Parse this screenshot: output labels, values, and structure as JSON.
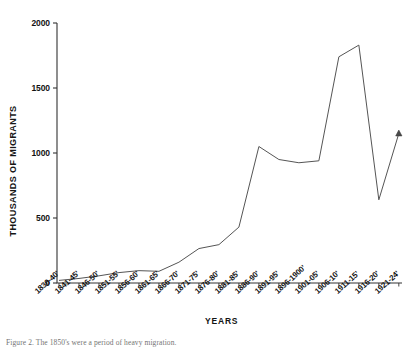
{
  "figure": {
    "caption": "Figure 2. The 1850's were a period of heavy migration.",
    "background_color": "#ffffff",
    "line_color": "#555555",
    "axis_color": "#333333"
  },
  "chart_data": {
    "type": "line",
    "title": "",
    "xlabel": "YEARS",
    "ylabel": "THOUSANDS OF MIGRANTS",
    "ylim": [
      0,
      2000
    ],
    "yticks": [
      0,
      500,
      1000,
      1500,
      2000
    ],
    "ytick_labels": [
      "0",
      "500",
      "1000",
      "1500",
      "2000"
    ],
    "grid": false,
    "legend": false,
    "marker_note": "triangle marker at final data point",
    "categories": [
      "1836-40'",
      "1841-45'",
      "1846-50'",
      "1851-55'",
      "1856-60'",
      "1861-65'",
      "1866-70'",
      "1871-75'",
      "1876-80'",
      "1881-85'",
      "1886-90'",
      "1891-95'",
      "1896-1900'",
      "1901-05'",
      "1906-10'",
      "1911-15'",
      "1916-20'",
      "1921-24'"
    ],
    "values": [
      20,
      35,
      55,
      80,
      95,
      90,
      160,
      265,
      295,
      430,
      1050,
      950,
      925,
      940,
      1740,
      1830,
      640,
      1150
    ]
  }
}
